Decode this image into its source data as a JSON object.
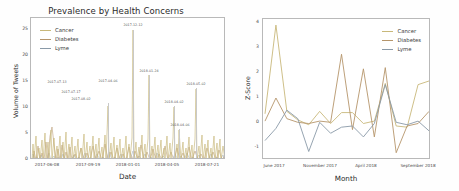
{
  "figure": {
    "background": "#ffffff",
    "colors": {
      "cancer": "#c8b87a",
      "diabetes": "#b5956b",
      "lyme": "#8a9aa8",
      "axis": "#b9b9b9",
      "text": "#2b2b2b"
    }
  },
  "left": {
    "title": "Prevalence by Health Concerns",
    "xlabel": "Date",
    "ylabel": "Volume of Tweets",
    "legend": [
      {
        "label": "Cancer",
        "color": "#c8b87a"
      },
      {
        "label": "Diabetes",
        "color": "#b5956b"
      },
      {
        "label": "Lyme",
        "color": "#8a9aa8"
      }
    ],
    "yticks": [
      "0",
      "5",
      "10",
      "15",
      "20",
      "25"
    ],
    "xticks": [
      "2017-06-08",
      "2017-09-19",
      "2018-01-01",
      "2018-04-05",
      "2018-07-21"
    ],
    "annotations": [
      {
        "text": "2017-07-13",
        "x": 0.135,
        "y": 0.455
      },
      {
        "text": "2017-07-17",
        "x": 0.205,
        "y": 0.525
      },
      {
        "text": "2017-08-02",
        "x": 0.255,
        "y": 0.575
      },
      {
        "text": "2017-04-06",
        "x": 0.395,
        "y": 0.445
      },
      {
        "text": "2017-12-12",
        "x": 0.525,
        "y": 0.045
      },
      {
        "text": "2018-01-24",
        "x": 0.605,
        "y": 0.27
      },
      {
        "text": "2018-04-02",
        "x": 0.735,
        "y": 0.425
      },
      {
        "text": "2018-04-06",
        "x": 0.76,
        "y": 0.585
      },
      {
        "text": "2018-05-02",
        "x": 0.845,
        "y": 0.33
      }
    ]
  },
  "right": {
    "xlabel": "Month",
    "ylabel": "Z-Score",
    "legend": [
      {
        "label": "Cancer",
        "color": "#c8b87a"
      },
      {
        "label": "Diabetes",
        "color": "#b5956b"
      },
      {
        "label": "Lyme",
        "color": "#8a9aa8"
      }
    ],
    "yticks": [
      "-1",
      "0",
      "1",
      "2",
      "3",
      "4"
    ],
    "xticks": [
      "June  2017",
      "November  2017",
      "April  2018",
      "September  2018"
    ]
  },
  "chart_data": [
    {
      "type": "line",
      "title": "Prevalence by Health Concerns",
      "xlabel": "Date",
      "ylabel": "Volume of Tweets",
      "ylim": [
        0,
        28
      ],
      "xlim": [
        "2017-06-08",
        "2018-09-01"
      ],
      "grid": false,
      "legend_position": "upper-left",
      "tick_labels_x": [
        "2017-06-08",
        "2017-09-19",
        "2018-01-01",
        "2018-04-05",
        "2018-07-21"
      ],
      "tick_labels_y": [
        0,
        5,
        10,
        15,
        20,
        25
      ],
      "annotated_peaks": [
        {
          "date": "2017-07-13",
          "volume": 13
        },
        {
          "date": "2017-07-17",
          "volume": 11
        },
        {
          "date": "2017-08-02",
          "volume": 10
        },
        {
          "date": "2017-04-06",
          "volume": 13
        },
        {
          "date": "2017-12-12",
          "volume": 28
        },
        {
          "date": "2018-01-24",
          "volume": 21
        },
        {
          "date": "2018-04-02",
          "volume": 14
        },
        {
          "date": "2018-04-06",
          "volume": 9
        },
        {
          "date": "2018-05-02",
          "volume": 17
        }
      ],
      "series": [
        {
          "name": "Cancer",
          "color": "#c8b87a",
          "note": "dense daily volume, baseline 1-5 tweets with frequent spikes to 8-28"
        },
        {
          "name": "Diabetes",
          "color": "#b5956b",
          "note": "dense daily volume, baseline 0-3 tweets, early peak cluster July 2017"
        },
        {
          "name": "Lyme",
          "color": "#8a9aa8",
          "note": "dense daily volume, baseline 0-2 tweets"
        }
      ]
    },
    {
      "type": "line",
      "title": "",
      "xlabel": "Month",
      "ylabel": "Z-Score",
      "ylim": [
        -1.8,
        4.0
      ],
      "grid": false,
      "legend_position": "upper-right",
      "tick_labels_y": [
        -1,
        0,
        1,
        2,
        3,
        4
      ],
      "tick_labels_x": [
        "June  2017",
        "November  2017",
        "April  2018",
        "September  2018"
      ],
      "categories": [
        "2017-06",
        "2017-07",
        "2017-08",
        "2017-09",
        "2017-10",
        "2017-11",
        "2017-12",
        "2018-01",
        "2018-02",
        "2018-03",
        "2018-04",
        "2018-05",
        "2018-06",
        "2018-07",
        "2018-08",
        "2018-09"
      ],
      "series": [
        {
          "name": "Cancer",
          "color": "#c8b87a",
          "values": [
            0.1,
            3.75,
            0.2,
            -0.15,
            -0.35,
            0.2,
            -0.3,
            0.15,
            0.15,
            -0.3,
            -0.2,
            1.35,
            -0.4,
            -0.45,
            1.3,
            1.45
          ]
        },
        {
          "name": "Diabetes",
          "color": "#b5956b",
          "values": [
            -0.2,
            0.75,
            -0.1,
            -0.25,
            -0.3,
            -0.2,
            -0.25,
            2.55,
            -0.55,
            1.95,
            -0.85,
            2.0,
            -1.5,
            -0.4,
            -0.3,
            0.2
          ]
        },
        {
          "name": "Lyme",
          "color": "#8a9aa8",
          "values": [
            -1.0,
            -0.5,
            0.25,
            -0.1,
            -1.45,
            -0.25,
            -0.7,
            -0.45,
            -0.4,
            -0.85,
            -0.3,
            1.3,
            -0.25,
            -0.35,
            -0.2,
            -0.6
          ]
        }
      ]
    }
  ]
}
